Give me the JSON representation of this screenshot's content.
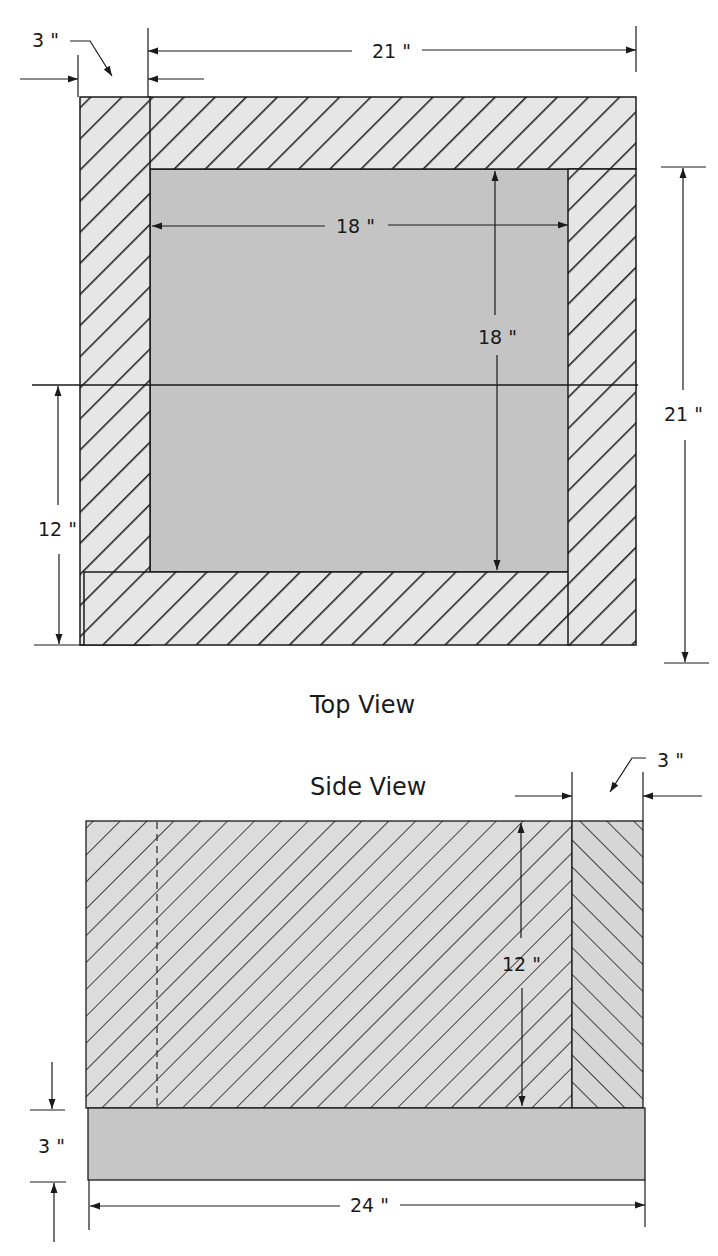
{
  "diagram": {
    "type": "technical drawing",
    "units": "inches",
    "colors": {
      "hatch_fill": "#e6e6e6",
      "solid_fill": "#c4c4c4",
      "line": "#1a1a1a"
    }
  },
  "top_view": {
    "title": "Top View",
    "dimensions": {
      "wall_thickness": "3 \"",
      "outer_width": "21 \"",
      "inner_width": "18 \"",
      "inner_depth": "18 \"",
      "outer_depth": "21 \"",
      "partial_height": "12 \""
    }
  },
  "side_view": {
    "title": "Side View",
    "dimensions": {
      "end_thickness": "3 \"",
      "wall_height": "12 \"",
      "base_thickness": "3 \"",
      "overall_length": "24 \""
    }
  }
}
